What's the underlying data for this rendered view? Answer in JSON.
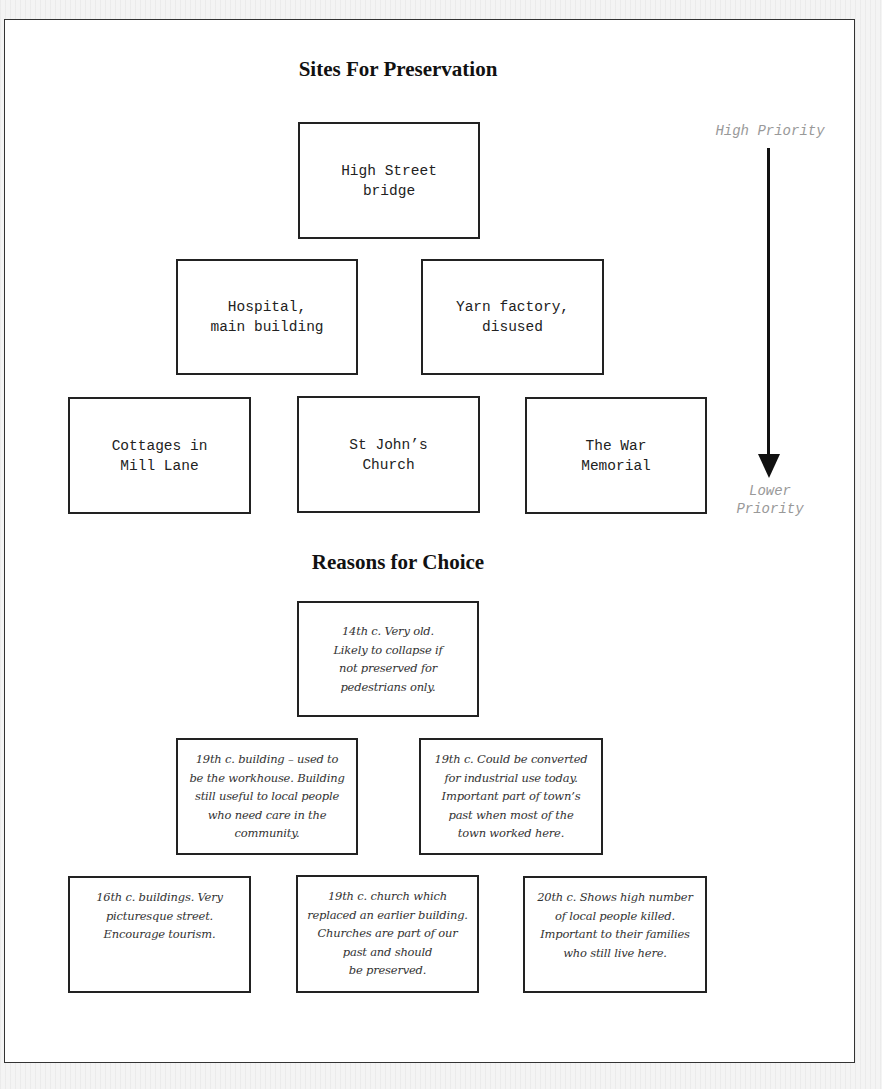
{
  "diagram": {
    "sites_title": "Sites For Preservation",
    "reasons_title": "Reasons for Choice",
    "priority_axis": {
      "high_label": "High Priority",
      "low_label": "Lower\nPriority",
      "direction": "top-to-bottom"
    },
    "sites": {
      "tier1": [
        {
          "label": "High Street\nbridge"
        }
      ],
      "tier2": [
        {
          "label": "Hospital,\nmain building"
        },
        {
          "label": "Yarn factory,\ndisused"
        }
      ],
      "tier3": [
        {
          "label": "Cottages in\nMill Lane"
        },
        {
          "label": "St John’s\nChurch"
        },
        {
          "label": "The War\nMemorial"
        }
      ]
    },
    "reasons": {
      "tier1": [
        {
          "text": "14th c. Very old.\nLikely to collapse if\nnot preserved for\npedestrians only."
        }
      ],
      "tier2": [
        {
          "text": "19th c. building – used to\nbe the workhouse. Building\nstill useful to local people\nwho need care in the\ncommunity."
        },
        {
          "text": "19th c. Could be converted\nfor industrial use today.\nImportant part of town’s\npast when most of the\ntown worked here."
        }
      ],
      "tier3": [
        {
          "text": "16th c. buildings. Very\npicturesque street.\nEncourage tourism."
        },
        {
          "text": "19th c. church which\nreplaced an earlier building.\nChurches are part of our\npast and should\nbe preserved."
        },
        {
          "text": "20th c. Shows high number\nof local people killed.\nImportant to their families\nwho still live here."
        }
      ]
    }
  }
}
